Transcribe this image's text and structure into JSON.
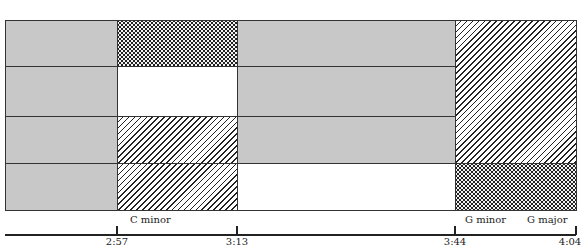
{
  "diagram": {
    "columns_x": [
      5,
      117,
      237,
      455,
      576
    ],
    "rows_y": [
      20,
      66,
      116,
      163,
      210
    ],
    "cells": [
      {
        "row": 0,
        "col": 0,
        "fill": "gray"
      },
      {
        "row": 0,
        "col": 1,
        "fill": "dots"
      },
      {
        "row": 0,
        "col": 2,
        "fill": "gray"
      },
      {
        "row": 1,
        "col": 0,
        "fill": "gray"
      },
      {
        "row": 1,
        "col": 1,
        "fill": "white"
      },
      {
        "row": 1,
        "col": 2,
        "fill": "gray"
      },
      {
        "row": 2,
        "col": 0,
        "fill": "gray"
      },
      {
        "row": 2,
        "col": 1,
        "fill": "hatch"
      },
      {
        "row": 2,
        "col": 2,
        "fill": "gray"
      },
      {
        "row": 3,
        "col": 0,
        "fill": "gray"
      },
      {
        "row": 3,
        "col": 1,
        "fill": "hatch"
      },
      {
        "row": 3,
        "col": 2,
        "fill": "white"
      },
      {
        "row": 0,
        "col": 3,
        "rowspan": 3,
        "fill": "hatch"
      },
      {
        "row": 3,
        "col": 3,
        "fill": "dots"
      }
    ],
    "timeline": {
      "ticks": [
        {
          "label": "2:57",
          "x": 117
        },
        {
          "label": "3:13",
          "x": 237
        },
        {
          "label": "3:44",
          "x": 455
        },
        {
          "label": "4:04",
          "x": 576
        }
      ],
      "key_labels": [
        {
          "label": "C minor",
          "x": 130
        },
        {
          "label": "G minor",
          "x": 465
        },
        {
          "label": "G major",
          "x": 527
        }
      ]
    }
  }
}
